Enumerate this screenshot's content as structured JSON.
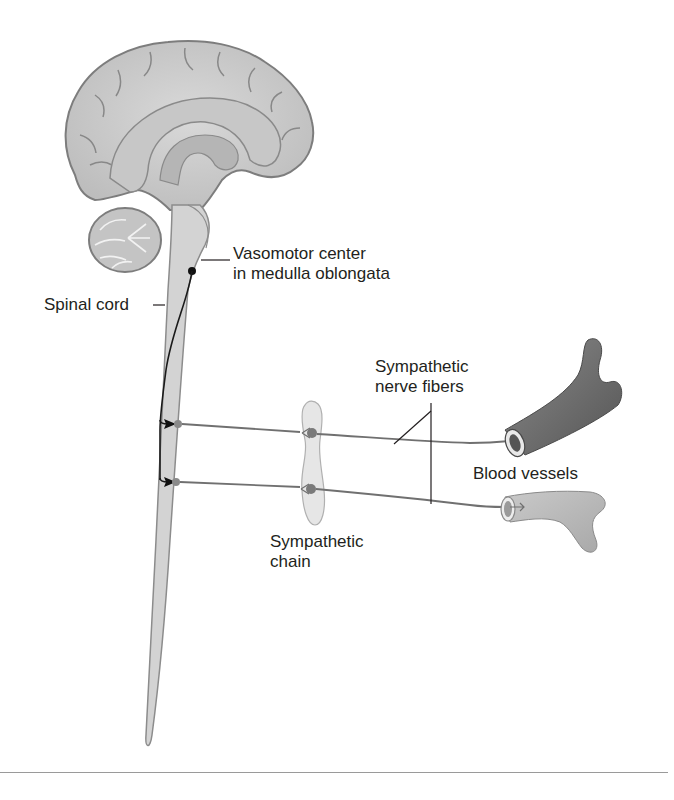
{
  "figure": {
    "type": "anatomical diagram",
    "colors": {
      "tissue": "#d3d3d3",
      "tissue_outline": "#8c8c8c",
      "nerve_fiber": "#707070",
      "pathway": "#1a1a1a",
      "vessel_dark": "#6a6a6a",
      "vessel_light": "#b8b8b8",
      "text": "#231f20"
    }
  },
  "labels": {
    "vasomotor": {
      "line1": "Vasomotor center",
      "line2": "in medulla oblongata"
    },
    "spinal_cord": {
      "line1": "Spinal cord"
    },
    "sympathetic_fibers": {
      "line1": "Sympathetic",
      "line2": "nerve fibers"
    },
    "blood_vessels": {
      "line1": "Blood vessels"
    },
    "sympathetic_chain": {
      "line1": "Sympathetic",
      "line2": "chain"
    }
  }
}
